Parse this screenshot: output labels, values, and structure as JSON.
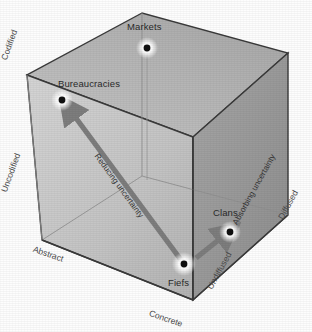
{
  "diagram": {
    "type": "3d-cube-conceptual",
    "background_color": "#fdfdfd",
    "faces": {
      "top_color": "#b9b9b9",
      "left_color": "#c9c9c9",
      "right_color": "#9a9a9a",
      "edge_color": "#3a3a3a",
      "inner_edge_color": "#8d8d8d"
    },
    "nodes": [
      {
        "id": "markets",
        "label": "Markets",
        "x": 147,
        "y": 48,
        "label_x": 127,
        "label_y": 22
      },
      {
        "id": "bureaucracies",
        "label": "Bureaucracies",
        "x": 62,
        "y": 100,
        "label_x": 63,
        "label_y": 79
      },
      {
        "id": "clans",
        "label": "Clans",
        "x": 230,
        "y": 232,
        "label_x": 216,
        "label_y": 208
      },
      {
        "id": "fiefs",
        "label": "Fiefs",
        "x": 184,
        "y": 264,
        "label_x": 170,
        "label_y": 278
      }
    ],
    "axis_labels": [
      {
        "id": "codified",
        "text": "Codified",
        "x": 5,
        "y": 60,
        "rotate": -70
      },
      {
        "id": "uncodified",
        "text": "Uncodified",
        "x": 5,
        "y": 195,
        "rotate": -70
      },
      {
        "id": "abstract",
        "text": "Abstract",
        "x": 40,
        "y": 250,
        "rotate": 18
      },
      {
        "id": "concrete",
        "text": "Concrete",
        "x": 155,
        "y": 313,
        "rotate": 18
      },
      {
        "id": "undiffused",
        "text": "Undiffused",
        "x": 208,
        "y": 288,
        "rotate": -62
      },
      {
        "id": "diffused",
        "text": "Diffused",
        "x": 278,
        "y": 218,
        "rotate": -62
      }
    ],
    "arrows": [
      {
        "id": "reducing-uncertainty",
        "label": "Reducing uncertainty",
        "from_x": 184,
        "from_y": 264,
        "to_x": 66,
        "to_y": 106,
        "color": "#7d7d7d",
        "label_x": 106,
        "label_y": 160,
        "label_rotate": 54
      },
      {
        "id": "absorbing-uncertainty",
        "label": "Absorbing uncertainty",
        "from_x": 190,
        "from_y": 257,
        "to_x": 228,
        "to_y": 232,
        "color": "#7d7d7d",
        "label_x": 232,
        "label_y": 225,
        "label_rotate": -62
      }
    ],
    "node_dot": {
      "color": "#101010",
      "radius": 3.4,
      "glow_color": "#ffffff"
    }
  }
}
